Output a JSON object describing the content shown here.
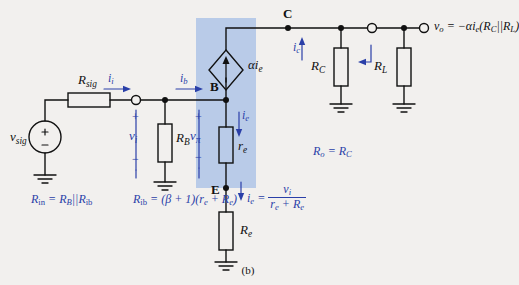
{
  "figure": {
    "caption": "(b)",
    "highlight_color": "#b9cbe8",
    "blue": "#2a3fa8",
    "black": "#111111"
  },
  "labels": {
    "r_sig": "R",
    "r_sig_sub": "sig",
    "v_sig": "v",
    "v_sig_sub": "sig",
    "i_i": "i",
    "i_i_sub": "i",
    "i_b": "i",
    "i_b_sub": "b",
    "node_b": "B",
    "node_c": "C",
    "node_e": "E",
    "v_i": "v",
    "v_i_sub": "i",
    "v_pi": "v",
    "v_pi_sub": "π",
    "r_b": "R",
    "r_b_sub": "B",
    "alpha_ie": "αi",
    "alpha_ie_sub": "e",
    "i_e_top": "i",
    "i_e_top_sub": "e",
    "r_e": "r",
    "r_e_sub": "e",
    "i_c": "i",
    "i_c_sub": "c",
    "r_C": "R",
    "r_C_sub": "C",
    "r_L": "R",
    "r_L_sub": "L",
    "R_e": "R",
    "R_e_sub": "e",
    "plus": "+",
    "minus": "−"
  },
  "equations": {
    "vo": "vₒ = −αiₑ(RＣ||RＬ)",
    "vo_v": "v",
    "vo_sub": "o",
    "vo_rhs": " = −αi",
    "vo_rhs2": "(R",
    "vo_rhs3": "||R",
    "vo_rhs4": ")",
    "rout": "Rₒ = RＣ",
    "rout_r": "R",
    "rout_sub": "o",
    "rout_eq": " = R",
    "rout_sub2": "C",
    "rin_r": "R",
    "rin_sub": "in",
    "rin_eq": " = R",
    "rin_sub2": "B",
    "rin_par": "||R",
    "rin_sub3": "ib",
    "rib_r": "R",
    "rib_sub": "ib",
    "rib_eq": " = (β + 1)(r",
    "rib_sub2": "e",
    "rib_plus": " + R",
    "rib_sub3": "e",
    "rib_close": ")",
    "ie_i": "i",
    "ie_sub": "e",
    "ie_eq": " = ",
    "ie_num_v": "v",
    "ie_num_sub": "i",
    "ie_den_r": "r",
    "ie_den_sub": "e",
    "ie_den_plus": " + R",
    "ie_den_sub2": "e"
  }
}
